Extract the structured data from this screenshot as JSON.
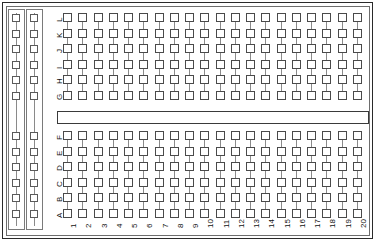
{
  "diagram": {
    "kind": "breadboard-pad-diagram"
  },
  "board": {
    "column_count": 20,
    "rows_top": [
      "L",
      "K",
      "J",
      "I",
      "H",
      "G"
    ],
    "rows_bottom": [
      "F",
      "E",
      "D",
      "C",
      "B",
      "A"
    ],
    "columns": [
      "1",
      "2",
      "3",
      "4",
      "5",
      "6",
      "7",
      "8",
      "9",
      "10",
      "11",
      "12",
      "13",
      "14",
      "15",
      "16",
      "17",
      "18",
      "19",
      "20"
    ],
    "power_rails": {
      "count": 2,
      "pads_top": 6,
      "pads_bottom": 6,
      "label": ""
    },
    "channel": {
      "label": ""
    },
    "colors": {
      "pad_stroke": "#4a4a4a",
      "trace": "#8a8a8a",
      "frame_outer": "#2a2a2a",
      "frame_inner": "#6d6d6d",
      "channel_stroke": "#3a3a3a",
      "background": "#ffffff",
      "text": "#111111"
    }
  }
}
